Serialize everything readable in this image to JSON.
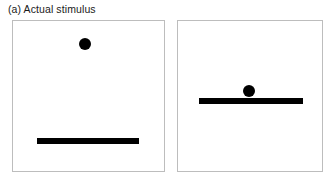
{
  "figure": {
    "caption": "(a) Actual stimulus",
    "panel_label": "(a)",
    "panel_title": "Actual stimulus"
  },
  "colors": {
    "background": "#ffffff",
    "panel_border": "#bdbdbd",
    "stimulus_ink": "#000000",
    "caption_text": "#1a1a1a"
  },
  "panels": [
    {
      "id": "left",
      "name": "dot-above-bar-far",
      "dot": {
        "cx_pct": 47.7,
        "cy_pct": 15.1,
        "diameter_px": 12
      },
      "bar": {
        "x_pct": 15.7,
        "y_pct": 80.3,
        "width_pct": 68.0,
        "thickness_px": 6
      }
    },
    {
      "id": "right",
      "name": "dot-above-bar-near",
      "dot": {
        "cx_pct": 49.3,
        "cy_pct": 46.7,
        "diameter_px": 12
      },
      "bar": {
        "x_pct": 14.4,
        "y_pct": 53.3,
        "width_pct": 72.6,
        "thickness_px": 6
      }
    }
  ],
  "chart_data": {
    "type": "scatter",
    "title": "(a) Actual stimulus",
    "xlabel": "",
    "ylabel": "",
    "xlim": [
      0,
      100
    ],
    "ylim": [
      0,
      100
    ],
    "grid": false,
    "legend": "none",
    "series": [
      {
        "name": "left-panel-dot",
        "x": [
          47.7
        ],
        "y": [
          84.9
        ]
      },
      {
        "name": "left-panel-bar",
        "x": [
          15.7,
          83.7
        ],
        "y": [
          19.7,
          19.7
        ]
      },
      {
        "name": "right-panel-dot",
        "x": [
          49.3
        ],
        "y": [
          53.3
        ]
      },
      {
        "name": "right-panel-bar",
        "x": [
          14.4,
          87.0
        ],
        "y": [
          46.7,
          46.7
        ]
      }
    ]
  }
}
